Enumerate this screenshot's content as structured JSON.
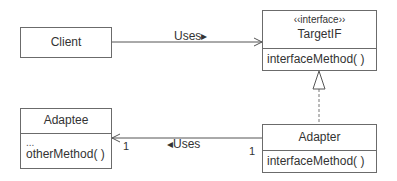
{
  "diagram": {
    "classes": {
      "client": {
        "name": "Client"
      },
      "target": {
        "stereotype": "‹‹interface››",
        "name": "TargetIF",
        "methods": [
          "interfaceMethod( )"
        ]
      },
      "adaptee": {
        "name": "Adaptee",
        "attributes": "...",
        "methods": [
          "otherMethod( )"
        ]
      },
      "adapter": {
        "name": "Adapter",
        "methods": [
          "interfaceMethod( )"
        ]
      }
    },
    "associations": {
      "client_target": {
        "label": "Uses▸"
      },
      "adapter_adaptee": {
        "label": "◂Uses",
        "mult_adaptee": "1",
        "mult_adapter": "1"
      }
    },
    "colors": {
      "line": "#555555",
      "border": "#6b6b6b",
      "text": "#333333"
    }
  }
}
